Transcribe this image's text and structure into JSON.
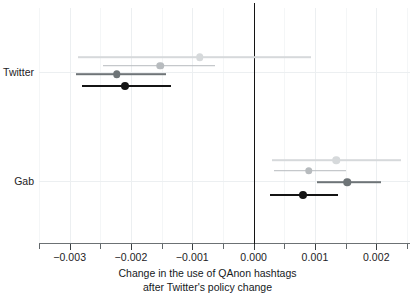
{
  "chart_data": {
    "type": "scatter",
    "subtype": "coefficient-plot-with-confidence-intervals",
    "title": "",
    "xlabel_line1": "Change in the use of QAnon hashtags",
    "xlabel_line2": "after Twitter's policy change",
    "ylabel": "",
    "xlim": [
      -0.0035,
      0.00255
    ],
    "xticks": [
      -0.003,
      -0.002,
      -0.001,
      0.0,
      0.001,
      0.002
    ],
    "xticklabels": [
      "−0.003",
      "−0.002",
      "−0.001",
      "0.000",
      "0.001",
      "0.002"
    ],
    "minor_xticks": [
      -0.0035,
      -0.0025,
      -0.0015,
      -0.0005,
      0.0005,
      0.0015,
      0.0025
    ],
    "grid": "vertical-light",
    "reference_line": 0.0,
    "legend": "none",
    "groups": [
      "Twitter",
      "Gab"
    ],
    "group_labels": {
      "twitter": "Twitter",
      "gab": "Gab"
    },
    "series": [
      {
        "name": "model-4-lightest",
        "color": "#d6d9db",
        "group": "Twitter",
        "estimate": -0.00088,
        "ci_low": -0.00287,
        "ci_high": 0.00094
      },
      {
        "name": "model-3-light",
        "color": "#b7bbbe",
        "group": "Twitter",
        "estimate": -0.00152,
        "ci_low": -0.00245,
        "ci_high": -0.00063
      },
      {
        "name": "model-2-medium",
        "color": "#6e7477",
        "group": "Twitter",
        "estimate": -0.00223,
        "ci_low": -0.0029,
        "ci_high": -0.00143
      },
      {
        "name": "model-1-black",
        "color": "#141414",
        "group": "Twitter",
        "estimate": -0.0021,
        "ci_low": -0.0028,
        "ci_high": -0.00135
      },
      {
        "name": "model-4-lightest",
        "color": "#d6d9db",
        "group": "Gab",
        "estimate": 0.00135,
        "ci_low": 0.0003,
        "ci_high": 0.0024
      },
      {
        "name": "model-3-light",
        "color": "#b7bbbe",
        "group": "Gab",
        "estimate": 0.0009,
        "ci_low": 0.00033,
        "ci_high": 0.0015
      },
      {
        "name": "model-2-medium",
        "color": "#6e7477",
        "group": "Gab",
        "estimate": 0.00153,
        "ci_low": 0.00103,
        "ci_high": 0.00208
      },
      {
        "name": "model-1-black",
        "color": "#141414",
        "group": "Gab",
        "estimate": 0.0008,
        "ci_low": 0.00027,
        "ci_high": 0.00138
      }
    ]
  },
  "colors": {
    "background": "#ffffff",
    "axis": "#555b5e",
    "grid": "#eceff1",
    "zero_reference": "#141414",
    "text": "#1d2124"
  }
}
